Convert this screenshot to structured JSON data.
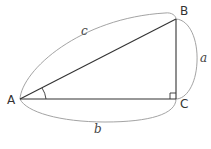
{
  "diagram": {
    "vertices": {
      "A": {
        "label": "A",
        "x": 20,
        "y": 99
      },
      "B": {
        "label": "B",
        "x": 176,
        "y": 19
      },
      "C": {
        "label": "C",
        "x": 176,
        "y": 99
      }
    },
    "sides": {
      "a": {
        "label": "a",
        "between": [
          "B",
          "C"
        ]
      },
      "b": {
        "label": "b",
        "between": [
          "A",
          "C"
        ]
      },
      "c": {
        "label": "c",
        "between": [
          "A",
          "B"
        ]
      }
    },
    "markers": {
      "angle_A": "arc",
      "right_angle_C": "square"
    },
    "colors": {
      "triangle": "#333333",
      "brace_arcs": "#999999"
    }
  }
}
